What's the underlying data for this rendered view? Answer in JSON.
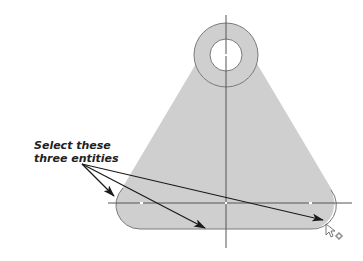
{
  "diagram": {
    "type": "cad-sketch-selection",
    "callout": {
      "line1": "Select these",
      "line2": "three entities"
    },
    "entities_indicated": [
      "left-end-arc",
      "bottom-line",
      "right-end-arc"
    ],
    "colors": {
      "part_fill": "#cfcfcf",
      "outline": "#7a7a7a",
      "centerline": "#555555",
      "arrow": "#1a1a1a",
      "background": "#ffffff"
    },
    "cursor": "select-cursor-with-plus"
  }
}
